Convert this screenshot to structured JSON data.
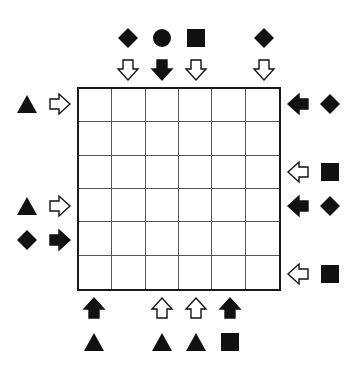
{
  "puzzle": {
    "grid_size": 6,
    "colors": {
      "ink": "#111111",
      "grid_line": "#555555",
      "background": "#ffffff"
    },
    "top_clues": [
      {
        "col": 1,
        "shape": "diamond",
        "arrow": "down",
        "arrow_fill": "hollow"
      },
      {
        "col": 2,
        "shape": "circle",
        "arrow": "down",
        "arrow_fill": "solid"
      },
      {
        "col": 3,
        "shape": "square",
        "arrow": "down",
        "arrow_fill": "hollow"
      },
      {
        "col": 5,
        "shape": "diamond",
        "arrow": "down",
        "arrow_fill": "hollow"
      }
    ],
    "left_clues": [
      {
        "row": 0,
        "shape": "triangle",
        "arrow": "right",
        "arrow_fill": "hollow"
      },
      {
        "row": 3,
        "shape": "triangle",
        "arrow": "right",
        "arrow_fill": "hollow"
      },
      {
        "row": 4,
        "shape": "diamond",
        "arrow": "right",
        "arrow_fill": "solid"
      }
    ],
    "right_clues": [
      {
        "row": 0,
        "shape": "diamond",
        "arrow": "left",
        "arrow_fill": "solid"
      },
      {
        "row": 2,
        "shape": "square",
        "arrow": "left",
        "arrow_fill": "hollow"
      },
      {
        "row": 3,
        "shape": "diamond",
        "arrow": "left",
        "arrow_fill": "solid"
      },
      {
        "row": 5,
        "shape": "square",
        "arrow": "left",
        "arrow_fill": "hollow"
      }
    ],
    "bottom_clues": [
      {
        "col": 0,
        "shape": "triangle",
        "arrow": "up",
        "arrow_fill": "solid"
      },
      {
        "col": 2,
        "shape": "triangle",
        "arrow": "up",
        "arrow_fill": "hollow"
      },
      {
        "col": 3,
        "shape": "triangle",
        "arrow": "up",
        "arrow_fill": "hollow"
      },
      {
        "col": 4,
        "shape": "square",
        "arrow": "up",
        "arrow_fill": "solid"
      }
    ],
    "cells": [
      [
        "",
        "",
        "",
        "",
        "",
        ""
      ],
      [
        "",
        "",
        "",
        "",
        "",
        ""
      ],
      [
        "",
        "",
        "",
        "",
        "",
        ""
      ],
      [
        "",
        "",
        "",
        "",
        "",
        ""
      ],
      [
        "",
        "",
        "",
        "",
        "",
        ""
      ],
      [
        "",
        "",
        "",
        "",
        "",
        ""
      ]
    ]
  }
}
